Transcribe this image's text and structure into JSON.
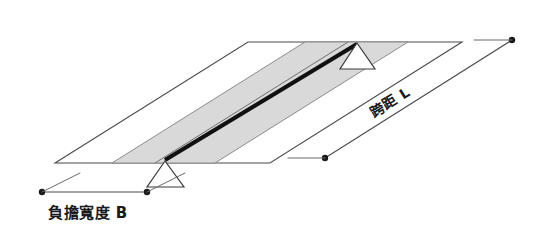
{
  "diagram": {
    "background_color": "#ffffff",
    "labels": {
      "load_width": "負擔寬度 B",
      "span": "跨距 L"
    },
    "elements": {
      "slab_name": "deck-slab",
      "strip_name": "tributary-load-strip",
      "beam_name": "main-girder",
      "support_near_name": "support-near",
      "support_far_name": "support-far"
    },
    "colors": {
      "strip_fill": "#d9d9d9",
      "outline": "#4a4a4a",
      "beam": "#111111",
      "dimension": "#4a4a4a"
    },
    "geometry": {
      "slab_corners": "55,163 248,42 462,42 270,163",
      "strip_polygon": "112,163 305,42 408,42 215,163",
      "strip_inner_edge": "155,163 348,42",
      "beam_start": "165,160",
      "beam_end": "357,44",
      "dim_b_left": "42,192",
      "dim_b_right": "147,192",
      "dim_l_low": "325,158",
      "dim_l_high": "512,40"
    }
  }
}
